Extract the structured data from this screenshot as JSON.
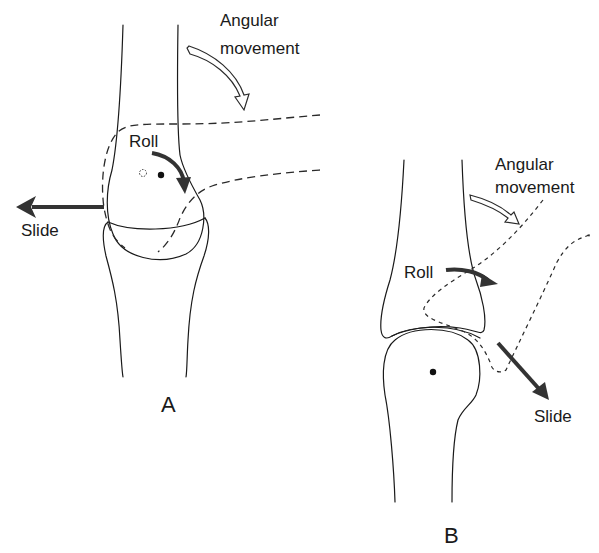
{
  "figure": {
    "panels": [
      {
        "id": "A",
        "label": "A",
        "annotations": {
          "angular": [
            "Angular",
            "movement"
          ],
          "roll": "Roll",
          "slide": "Slide"
        },
        "slide_direction": "left",
        "description": "Convex bone rotating on concave surface: roll and slide in opposite directions"
      },
      {
        "id": "B",
        "label": "B",
        "annotations": {
          "angular": [
            "Angular",
            "movement"
          ],
          "roll": "Roll",
          "slide": "Slide"
        },
        "slide_direction": "down-right",
        "description": "Concave bone moving on convex surface: roll and slide in the same direction"
      }
    ],
    "colors": {
      "line": "#1a1a1a",
      "arrow": "#333333",
      "background": "#ffffff"
    }
  }
}
